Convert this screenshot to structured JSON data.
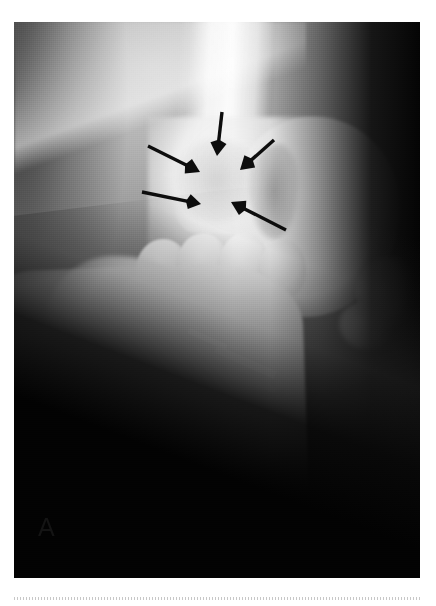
{
  "figure": {
    "panel_label": "A",
    "modality": "radiograph",
    "view": "lateral",
    "caption_visible": false
  },
  "radiograph": {
    "plate": {
      "left": 14,
      "top": 22,
      "width": 406,
      "height": 556,
      "background_color": "#0a0a0a"
    },
    "exposure": {
      "soft_tissue_tone": "#9a9a9a",
      "bone_tone": "#f6f6f6",
      "background_air_tone": "#040404",
      "highlight_tone": "#ffffff"
    },
    "anatomy": [
      {
        "name": "proximal-shaft",
        "label": "proximal long bone shaft"
      },
      {
        "name": "metaphysis-flare",
        "label": "distal metaphyseal flare"
      },
      {
        "name": "condyle",
        "label": "rounded articular condyle"
      },
      {
        "name": "condyle-notch",
        "label": "intercondylar notch"
      },
      {
        "name": "carpal-row",
        "label": "short bone row"
      },
      {
        "name": "distal-shaft",
        "label": "distal oblique shaft"
      },
      {
        "name": "tuberosity",
        "label": "proximal tuberosity"
      },
      {
        "name": "sesamoid",
        "label": "sesamoid ossicle"
      },
      {
        "name": "lesion-zone",
        "label": "lucent lesion"
      }
    ],
    "markers": [
      {
        "name": "radiodense-marker-strip",
        "label": "radiodense marker strip",
        "count": 3
      }
    ]
  },
  "annotations": {
    "color": "#0d0d0d",
    "count": 5,
    "arrows": [
      {
        "id": "arrow-1",
        "label": "upper-left arrow",
        "x1": 134,
        "y1": 124,
        "x2": 186,
        "y2": 150,
        "head": 13
      },
      {
        "id": "arrow-2",
        "label": "vertical arrow",
        "x1": 208,
        "y1": 90,
        "x2": 203,
        "y2": 134,
        "head": 13
      },
      {
        "id": "arrow-3",
        "label": "upper-right arrow",
        "x1": 260,
        "y1": 118,
        "x2": 226,
        "y2": 148,
        "head": 13
      },
      {
        "id": "arrow-4",
        "label": "lower-left arrow",
        "x1": 128,
        "y1": 170,
        "x2": 187,
        "y2": 182,
        "head": 12
      },
      {
        "id": "arrow-5",
        "label": "lower-right arrow",
        "x1": 272,
        "y1": 208,
        "x2": 217,
        "y2": 180,
        "head": 13
      }
    ]
  },
  "artifacts": {
    "bottom_rule": "dotted scan edge"
  }
}
